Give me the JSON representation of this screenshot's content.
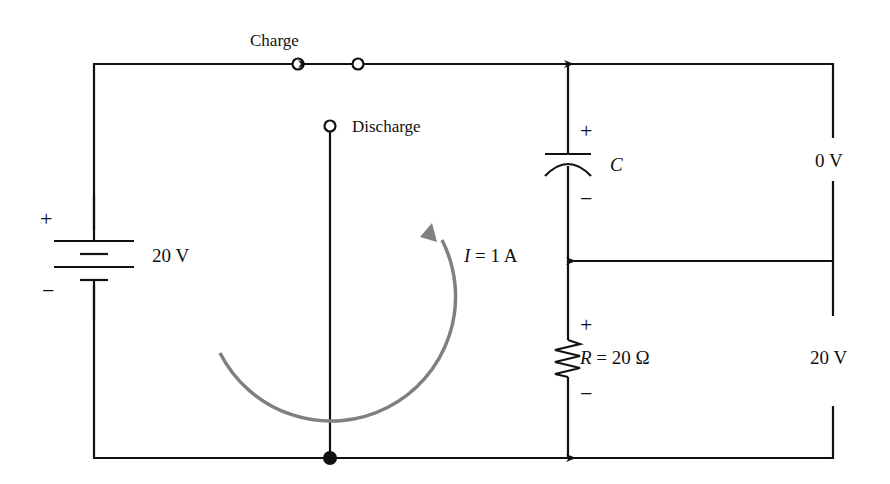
{
  "diagram": {
    "type": "RC circuit charge/discharge schematic",
    "switch": {
      "charge_label": "Charge",
      "discharge_label": "Discharge"
    },
    "battery": {
      "voltage_label": "20 V",
      "plus": "+",
      "minus": "−"
    },
    "capacitor": {
      "label": "C",
      "plus": "+",
      "minus": "−",
      "voltage_label": "0 V"
    },
    "resistor": {
      "label_symbol": "R",
      "label_value": " = 20 Ω",
      "plus": "+",
      "minus": "−",
      "voltage_label": "20 V"
    },
    "current": {
      "label_symbol": "I",
      "label_value": " = 1 A"
    },
    "colors": {
      "wire": "#111111",
      "current_arrow": "#808080",
      "background": "#ffffff"
    }
  }
}
